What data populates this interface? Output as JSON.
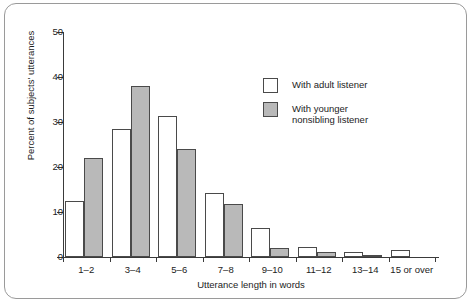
{
  "chart_data": {
    "type": "bar",
    "title": "",
    "xlabel": "Utterance length in words",
    "ylabel": "Percent of subjects' utterances",
    "ylim": [
      0,
      50
    ],
    "yticks": [
      0,
      10,
      20,
      30,
      40,
      50
    ],
    "grid": false,
    "legend_position": "upper right",
    "categories": [
      "1–2",
      "3–4",
      "5–6",
      "7–8",
      "9–10",
      "11–12",
      "13–14",
      "15 or over"
    ],
    "series": [
      {
        "name": "With adult listener",
        "color": "#ffffff",
        "values": [
          12.5,
          28.5,
          31.3,
          14.3,
          6.5,
          2.3,
          1.2,
          1.6
        ]
      },
      {
        "name": "With younger\nnonsibling listener",
        "color": "#b9b9b9",
        "values": [
          22.0,
          38.0,
          24.0,
          11.8,
          2.0,
          1.1,
          0.4,
          0.0
        ]
      }
    ]
  },
  "legend": {
    "items": [
      {
        "label": "With adult listener",
        "swatch": "white-square-swatch"
      },
      {
        "label": "With younger\nnonsibling listener",
        "swatch": "gray-square-swatch"
      }
    ]
  },
  "caption": ""
}
